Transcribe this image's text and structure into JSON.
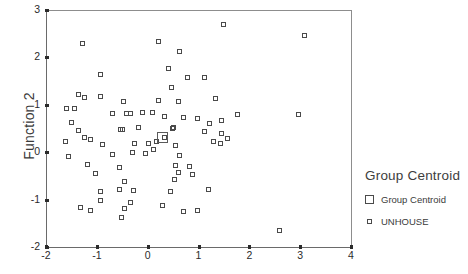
{
  "chart_data": {
    "type": "scatter",
    "title": "",
    "xlabel": "",
    "ylabel": "Function 2",
    "xlim": [
      -2,
      4
    ],
    "ylim": [
      -2,
      3
    ],
    "xticks": [
      -2,
      -1,
      0,
      1,
      2,
      3,
      4
    ],
    "yticks": [
      -2,
      -1,
      0,
      1,
      2,
      3
    ],
    "grid": false,
    "legend_position": "right",
    "series": [
      {
        "name": "UNHOUSE",
        "marker": "open-square-small",
        "points": [
          [
            -1.29,
            2.29
          ],
          [
            0.22,
            2.34
          ],
          [
            0.62,
            2.13
          ],
          [
            1.49,
            2.7
          ],
          [
            3.08,
            2.46
          ],
          [
            -0.93,
            1.63
          ],
          [
            0.4,
            1.77
          ],
          [
            0.78,
            1.58
          ],
          [
            1.12,
            1.57
          ],
          [
            -1.37,
            1.21
          ],
          [
            -1.25,
            1.15
          ],
          [
            -0.93,
            1.17
          ],
          [
            0.46,
            1.36
          ],
          [
            -0.48,
            1.06
          ],
          [
            0.21,
            1.1
          ],
          [
            0.6,
            1.06
          ],
          [
            1.34,
            1.13
          ],
          [
            -1.6,
            0.93
          ],
          [
            -1.44,
            0.92
          ],
          [
            1.77,
            0.8
          ],
          [
            2.96,
            0.8
          ],
          [
            -0.7,
            0.82
          ],
          [
            -0.41,
            0.81
          ],
          [
            -0.33,
            0.81
          ],
          [
            -0.1,
            0.84
          ],
          [
            0.1,
            0.83
          ],
          [
            0.33,
            0.76
          ],
          [
            0.7,
            0.73
          ],
          [
            0.98,
            0.72
          ],
          [
            -1.5,
            0.63
          ],
          [
            1.22,
            0.6
          ],
          [
            1.46,
            0.66
          ],
          [
            -1.37,
            0.46
          ],
          [
            -0.53,
            0.47
          ],
          [
            -0.49,
            0.47
          ],
          [
            -0.19,
            0.52
          ],
          [
            0.48,
            0.49
          ],
          [
            0.5,
            0.52
          ],
          [
            1.12,
            0.44
          ],
          [
            1.46,
            0.4
          ],
          [
            -1.25,
            0.3
          ],
          [
            -1.13,
            0.27
          ],
          [
            0.34,
            0.3
          ],
          [
            1.58,
            0.28
          ],
          [
            -1.62,
            0.22
          ],
          [
            -0.89,
            0.17
          ],
          [
            -0.26,
            0.18
          ],
          [
            0.02,
            0.19
          ],
          [
            0.18,
            0.23
          ],
          [
            0.55,
            0.14
          ],
          [
            1.3,
            0.22
          ],
          [
            1.44,
            0.18
          ],
          [
            -1.56,
            -0.1
          ],
          [
            -0.7,
            -0.05
          ],
          [
            -0.3,
            0.0
          ],
          [
            -0.05,
            -0.02
          ],
          [
            0.12,
            0.05
          ],
          [
            0.63,
            -0.06
          ],
          [
            -1.18,
            -0.27
          ],
          [
            -0.55,
            -0.33
          ],
          [
            0.55,
            -0.28
          ],
          [
            0.82,
            -0.3
          ],
          [
            -1.03,
            -0.45
          ],
          [
            0.6,
            -0.43
          ],
          [
            0.88,
            -0.48
          ],
          [
            -0.46,
            -0.62
          ],
          [
            0.53,
            -0.57
          ],
          [
            -0.93,
            -0.83
          ],
          [
            -0.55,
            -0.78
          ],
          [
            -0.28,
            -0.8
          ],
          [
            0.44,
            -0.82
          ],
          [
            1.2,
            -0.78
          ],
          [
            -0.92,
            -1.02
          ],
          [
            -0.33,
            -1.06
          ],
          [
            0.3,
            -1.12
          ],
          [
            -1.33,
            -1.16
          ],
          [
            -1.12,
            -1.24
          ],
          [
            -0.45,
            -1.18
          ],
          [
            0.7,
            -1.25
          ],
          [
            0.98,
            -1.24
          ],
          [
            -0.52,
            -1.37
          ],
          [
            2.6,
            -1.66
          ]
        ]
      },
      {
        "name": "Group Centroid",
        "marker": "open-square-large",
        "points": [
          [
            0.29,
            0.3
          ]
        ]
      }
    ]
  },
  "axes": {
    "y_title": "Function 2",
    "x_tick_labels": [
      "-2",
      "-1",
      "0",
      "1",
      "2",
      "3",
      "4"
    ],
    "y_tick_labels": [
      "3",
      "2",
      "1",
      "0",
      "-1",
      "-2"
    ]
  },
  "legend": {
    "title": "Group Centroid",
    "entries": [
      {
        "label": "Group Centroid",
        "marker": "open-square-large"
      },
      {
        "label": "UNHOUSE",
        "marker": "open-square-small"
      }
    ]
  },
  "colors": {
    "marker_stroke": "#4a4a4a",
    "axis": "#6a6a6a",
    "text": "#3a3a3a",
    "background": "#ffffff"
  }
}
